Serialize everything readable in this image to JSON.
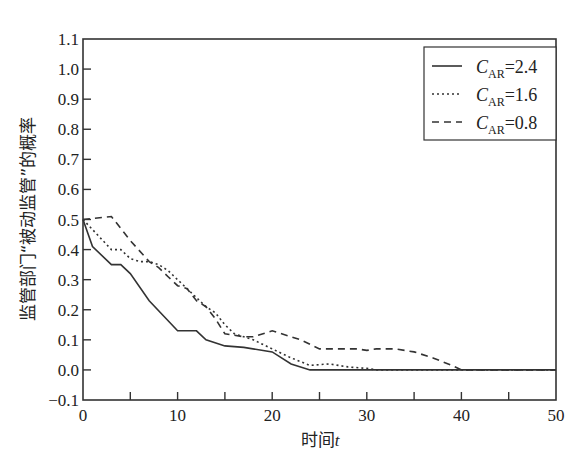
{
  "chart_data": {
    "type": "line",
    "title": "",
    "xlabel": "时间",
    "xlabel_var": "t",
    "ylabel": "监管部门“被动监管”的概率",
    "xlim": [
      0,
      50
    ],
    "ylim": [
      -0.1,
      1.1
    ],
    "xticks": [
      0,
      10,
      20,
      30,
      40,
      50
    ],
    "xticks_minor": [
      5,
      15,
      25,
      35,
      45
    ],
    "yticks": [
      -0.1,
      0.0,
      0.1,
      0.2,
      0.3,
      0.4,
      0.5,
      0.6,
      0.7,
      0.8,
      0.9,
      1.0,
      1.1
    ],
    "ytick_labels": [
      "−0.1",
      "0.0",
      "0.1",
      "0.2",
      "0.3",
      "0.4",
      "0.5",
      "0.6",
      "0.7",
      "0.8",
      "0.9",
      "1.0",
      "1.1"
    ],
    "grid": false,
    "legend_position": "upper right",
    "series": [
      {
        "name": "C_AR=2.4",
        "label_main": "C",
        "label_sub": "AR",
        "label_value": "=2.4",
        "style": "solid",
        "color": "#333333",
        "points": [
          [
            0,
            0.5
          ],
          [
            1,
            0.41
          ],
          [
            3,
            0.35
          ],
          [
            4,
            0.35
          ],
          [
            5,
            0.32
          ],
          [
            7,
            0.23
          ],
          [
            10,
            0.13
          ],
          [
            12,
            0.13
          ],
          [
            13,
            0.1
          ],
          [
            15,
            0.08
          ],
          [
            17,
            0.075
          ],
          [
            20,
            0.06
          ],
          [
            22,
            0.02
          ],
          [
            24,
            0.0
          ],
          [
            50,
            0.0
          ]
        ]
      },
      {
        "name": "C_AR=1.6",
        "label_main": "C",
        "label_sub": "AR",
        "label_value": "=1.6",
        "style": "dotted",
        "color": "#333333",
        "points": [
          [
            0,
            0.5
          ],
          [
            3,
            0.4
          ],
          [
            4,
            0.4
          ],
          [
            5,
            0.37
          ],
          [
            6,
            0.36
          ],
          [
            7,
            0.36
          ],
          [
            8,
            0.35
          ],
          [
            9,
            0.33
          ],
          [
            10,
            0.3
          ],
          [
            11,
            0.27
          ],
          [
            12,
            0.24
          ],
          [
            13,
            0.21
          ],
          [
            14,
            0.19
          ],
          [
            15,
            0.15
          ],
          [
            16,
            0.12
          ],
          [
            17,
            0.11
          ],
          [
            18,
            0.1
          ],
          [
            20,
            0.07
          ],
          [
            22,
            0.04
          ],
          [
            24,
            0.015
          ],
          [
            26,
            0.02
          ],
          [
            28,
            0.01
          ],
          [
            30,
            0.005
          ],
          [
            31,
            0.0
          ],
          [
            50,
            0.0
          ]
        ]
      },
      {
        "name": "C_AR=0.8",
        "label_main": "C",
        "label_sub": "AR",
        "label_value": "=0.8",
        "style": "dashed",
        "color": "#333333",
        "points": [
          [
            0,
            0.5
          ],
          [
            3,
            0.51
          ],
          [
            5,
            0.43
          ],
          [
            7,
            0.36
          ],
          [
            8,
            0.34
          ],
          [
            9,
            0.31
          ],
          [
            10,
            0.28
          ],
          [
            11,
            0.27
          ],
          [
            12,
            0.23
          ],
          [
            13,
            0.21
          ],
          [
            14,
            0.17
          ],
          [
            15,
            0.12
          ],
          [
            17,
            0.11
          ],
          [
            18,
            0.11
          ],
          [
            20,
            0.13
          ],
          [
            22,
            0.11
          ],
          [
            23,
            0.1
          ],
          [
            25,
            0.07
          ],
          [
            27,
            0.07
          ],
          [
            29,
            0.07
          ],
          [
            30,
            0.065
          ],
          [
            31,
            0.07
          ],
          [
            33,
            0.07
          ],
          [
            35,
            0.06
          ],
          [
            37,
            0.04
          ],
          [
            39,
            0.015
          ],
          [
            40,
            0.0
          ],
          [
            50,
            0.0
          ]
        ]
      }
    ]
  }
}
